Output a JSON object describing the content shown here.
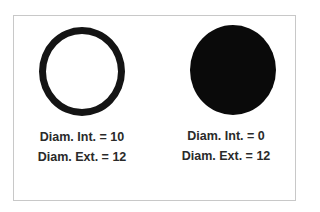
{
  "diagram": {
    "left": {
      "shape": "ring",
      "line1": "Diam. Int. = 10",
      "line2": "Diam. Ext. = 12"
    },
    "right": {
      "shape": "filled-circle",
      "line1": "Diam. Int. = 0",
      "line2": "Diam. Ext. = 12"
    },
    "colors": {
      "shape": "#141414",
      "text": "#2a2a2a",
      "frame": "#c8c8c8"
    }
  }
}
